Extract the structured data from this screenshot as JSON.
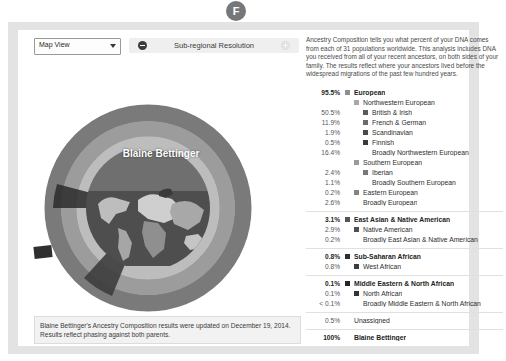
{
  "badge": {
    "letter": "F",
    "name": "section-badge"
  },
  "toolbar": {
    "view_select_value": "Map View",
    "resolution_label": "Sub-regional Resolution",
    "zoom_out_icon": "minus-circle-icon",
    "zoom_in_icon": "plus-circle-icon",
    "caret_icon": "chevron-down-icon"
  },
  "chart_title": "Blaine Bettinger",
  "description": "Ancestry Composition tells you what percent of your DNA comes from each of 31 populations worldwide. This analysis includes DNA you received from all of your recent ancestors, on both sides of your family. The results reflect where your ancestors lived before the widespread migrations of the past few hundred years.",
  "caption": "Blaine Bettinger's Ancestry Composition results were updated on December 19, 2014. Results reflect phasing against both parents.",
  "colors": {
    "european": "#8e8e8e",
    "northwestern_european": "#a8a8a8",
    "british_irish": "#5a5a5a",
    "french_german": "#6b6b6b",
    "scandinavian": "#4a4a4a",
    "finnish": "#3a3a3a",
    "southern_european": "#9a9a9a",
    "iberian": "#787878",
    "eastern_european": "#858585",
    "east_asian_native_american": "#555555",
    "native_american": "#4f4f4f",
    "sub_saharan_african": "#2e2e2e",
    "west_african": "#3b3b3b",
    "middle_eastern_north_african": "#262626",
    "north_african": "#333333",
    "unassigned": "#d8d8d8",
    "panel": "#e3e3e3",
    "card": "#ffffff"
  },
  "chart_data": {
    "type": "pie",
    "title": "Blaine Bettinger",
    "subtitle": "Ancestry Composition",
    "legend_position": "right",
    "rings": [
      "continental",
      "regional",
      "sub-regional"
    ],
    "slices": [
      {
        "label": "British & Irish",
        "value": 50.5,
        "ring": "sub-regional",
        "parent": "Northwestern European"
      },
      {
        "label": "French & German",
        "value": 11.9,
        "ring": "sub-regional",
        "parent": "Northwestern European"
      },
      {
        "label": "Scandinavian",
        "value": 1.9,
        "ring": "sub-regional",
        "parent": "Northwestern European"
      },
      {
        "label": "Finnish",
        "value": 0.5,
        "ring": "sub-regional",
        "parent": "Northwestern European"
      },
      {
        "label": "Broadly Northwestern European",
        "value": 16.4,
        "ring": "sub-regional",
        "parent": "Northwestern European"
      },
      {
        "label": "Iberian",
        "value": 2.4,
        "ring": "sub-regional",
        "parent": "Southern European"
      },
      {
        "label": "Broadly Southern European",
        "value": 1.1,
        "ring": "sub-regional",
        "parent": "Southern European"
      },
      {
        "label": "Eastern European",
        "value": 0.2,
        "ring": "regional",
        "parent": "European"
      },
      {
        "label": "Broadly European",
        "value": 2.6,
        "ring": "regional",
        "parent": "European"
      },
      {
        "label": "Native American",
        "value": 2.9,
        "ring": "sub-regional",
        "parent": "East Asian & Native American"
      },
      {
        "label": "Broadly East Asian & Native American",
        "value": 0.2,
        "ring": "sub-regional",
        "parent": "East Asian & Native American"
      },
      {
        "label": "West African",
        "value": 0.8,
        "ring": "sub-regional",
        "parent": "Sub-Saharan African"
      },
      {
        "label": "North African",
        "value": 0.1,
        "ring": "sub-regional",
        "parent": "Middle Eastern & North African"
      },
      {
        "label": "Broadly Middle Eastern & North African",
        "value": 0.05,
        "ring": "sub-regional",
        "parent": "Middle Eastern & North African"
      },
      {
        "label": "Unassigned",
        "value": 0.5,
        "ring": "continental",
        "parent": null
      }
    ],
    "continental": [
      {
        "label": "European",
        "value": 95.5
      },
      {
        "label": "East Asian & Native American",
        "value": 3.1
      },
      {
        "label": "Sub-Saharan African",
        "value": 0.8
      },
      {
        "label": "Middle Eastern & North African",
        "value": 0.1
      },
      {
        "label": "Unassigned",
        "value": 0.5
      }
    ],
    "total": {
      "label": "Blaine Bettinger",
      "value": 100
    }
  },
  "legend": {
    "groups": [
      {
        "rows": [
          {
            "pct": "95.5%",
            "label": "European",
            "level": 0,
            "swatch": "#8e8e8e",
            "strong": true
          },
          {
            "pct": "",
            "label": "Northwestern European",
            "level": 1,
            "swatch": "#a8a8a8",
            "strong": false
          },
          {
            "pct": "50.5%",
            "label": "British & Irish",
            "level": 2,
            "swatch": "#5a5a5a",
            "strong": false
          },
          {
            "pct": "11.9%",
            "label": "French & German",
            "level": 2,
            "swatch": "#6b6b6b",
            "strong": false
          },
          {
            "pct": "1.9%",
            "label": "Scandinavian",
            "level": 2,
            "swatch": "#4a4a4a",
            "strong": false
          },
          {
            "pct": "0.5%",
            "label": "Finnish",
            "level": 2,
            "swatch": "#3a3a3a",
            "strong": false
          },
          {
            "pct": "16.4%",
            "label": "Broadly Northwestern European",
            "level": 2,
            "swatch": "",
            "strong": false
          },
          {
            "pct": "",
            "label": "Southern European",
            "level": 1,
            "swatch": "#9a9a9a",
            "strong": false
          },
          {
            "pct": "2.4%",
            "label": "Iberian",
            "level": 2,
            "swatch": "#787878",
            "strong": false
          },
          {
            "pct": "1.1%",
            "label": "Broadly Southern European",
            "level": 2,
            "swatch": "",
            "strong": false
          },
          {
            "pct": "0.2%",
            "label": "Eastern European",
            "level": 1,
            "swatch": "#858585",
            "strong": false
          },
          {
            "pct": "2.6%",
            "label": "Broadly European",
            "level": 1,
            "swatch": "",
            "strong": false
          }
        ]
      },
      {
        "rows": [
          {
            "pct": "3.1%",
            "label": "East Asian & Native American",
            "level": 0,
            "swatch": "#555555",
            "strong": true
          },
          {
            "pct": "2.9%",
            "label": "Native American",
            "level": 1,
            "swatch": "#4f4f4f",
            "strong": false
          },
          {
            "pct": "0.2%",
            "label": "Broadly East Asian & Native American",
            "level": 1,
            "swatch": "",
            "strong": false
          }
        ]
      },
      {
        "rows": [
          {
            "pct": "0.8%",
            "label": "Sub-Saharan African",
            "level": 0,
            "swatch": "#2e2e2e",
            "strong": true
          },
          {
            "pct": "0.8%",
            "label": "West African",
            "level": 1,
            "swatch": "#3b3b3b",
            "strong": false
          }
        ]
      },
      {
        "rows": [
          {
            "pct": "0.1%",
            "label": "Middle Eastern & North African",
            "level": 0,
            "swatch": "#262626",
            "strong": true
          },
          {
            "pct": "0.1%",
            "label": "North African",
            "level": 1,
            "swatch": "#333333",
            "strong": false
          },
          {
            "pct": "< 0.1%",
            "label": "Broadly Middle Eastern & North African",
            "level": 1,
            "swatch": "",
            "strong": false
          }
        ]
      },
      {
        "rows": [
          {
            "pct": "0.5%",
            "label": "Unassigned",
            "level": 0,
            "swatch": "",
            "strong": false
          }
        ]
      },
      {
        "rows": [
          {
            "pct": "100%",
            "label": "Blaine Bettinger",
            "level": 0,
            "swatch": "",
            "strong": true
          }
        ]
      }
    ]
  }
}
